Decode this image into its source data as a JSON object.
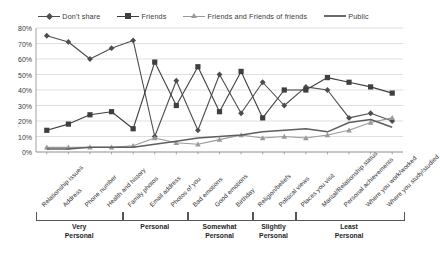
{
  "chart_data": {
    "type": "line",
    "title": "",
    "xlabel": "",
    "ylabel": "",
    "ylim": [
      0,
      80
    ],
    "ytick_labels": [
      "0%",
      "10%",
      "20%",
      "30%",
      "40%",
      "50%",
      "60%",
      "70%",
      "80%"
    ],
    "ytick_values": [
      0,
      10,
      20,
      30,
      40,
      50,
      60,
      70,
      80
    ],
    "grid": true,
    "legend_position": "top-center",
    "categories": [
      "Relationship issues",
      "Address",
      "Phone number",
      "Health and history",
      "Family photos",
      "Email address",
      "Photos of you",
      "Bad emotions",
      "Good emotions",
      "Birthday",
      "Religion/beliefs",
      "Political views",
      "Places you visit",
      "Marital/Relationship status",
      "Personal achievements",
      "Where you work/worked",
      "Where you study/studied"
    ],
    "series": [
      {
        "name": "Don't share",
        "marker": "diamond",
        "color": "#4d4d4d",
        "values": [
          75,
          71,
          60,
          67,
          72,
          10,
          46,
          14,
          50,
          25,
          45,
          30,
          42,
          40,
          22,
          25,
          20
        ]
      },
      {
        "name": "Friends",
        "marker": "square",
        "color": "#3f3f3f",
        "values": [
          14,
          18,
          24,
          26,
          15,
          58,
          30,
          55,
          26,
          52,
          22,
          40,
          40,
          48,
          45,
          42,
          38
        ]
      },
      {
        "name": "Friends and Friends of friends",
        "marker": "triangle",
        "color": "#9a9a9a",
        "values": [
          3,
          3,
          3,
          3,
          4,
          9,
          6,
          5,
          8,
          11,
          9,
          10,
          9,
          11,
          14,
          19,
          22
        ]
      },
      {
        "name": "Public",
        "marker": "none",
        "color": "#5e5e5e",
        "values": [
          2,
          2,
          3,
          3,
          3,
          5,
          7,
          9,
          10,
          11,
          13,
          14,
          15,
          13,
          19,
          21,
          16
        ]
      }
    ],
    "groups": [
      {
        "label": "Very\nPersonal",
        "start": 0,
        "end": 3
      },
      {
        "label": "Personal",
        "start": 4,
        "end": 6
      },
      {
        "label": "Somewhat\nPersonal",
        "start": 7,
        "end": 9
      },
      {
        "label": "Slightly\nPersonal",
        "start": 10,
        "end": 11
      },
      {
        "label": "Least\nPersonal",
        "start": 12,
        "end": 16
      }
    ]
  }
}
